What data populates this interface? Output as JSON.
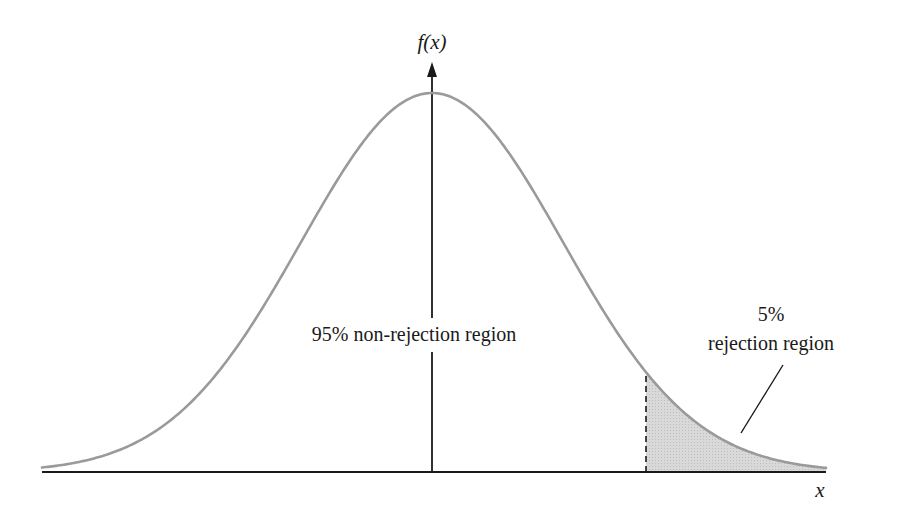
{
  "chart_data": {
    "type": "area",
    "title": "",
    "distribution": "normal",
    "xlabel": "x",
    "ylabel": "f(x)",
    "grid": false,
    "legend": null,
    "regions": [
      {
        "name": "non-rejection",
        "label": "95% non-rejection region",
        "percent": 95,
        "shaded": false
      },
      {
        "name": "rejection",
        "label_line1": "5%",
        "label_line2": "rejection region",
        "percent": 5,
        "shaded": true,
        "tail": "right"
      }
    ],
    "critical_value_z": 1.645,
    "x_range_z": [
      -3.0,
      3.0
    ],
    "annotations": [
      {
        "text": "95% non-rejection region",
        "position": "center-left of vertical axis"
      },
      {
        "text": "5% rejection region",
        "position": "upper right, with pointer line to shaded tail"
      }
    ]
  },
  "labels": {
    "y_axis": "f(x)",
    "x_axis": "x",
    "center_region": "95% non-rejection region",
    "tail_percent": "5%",
    "tail_region": "rejection region"
  },
  "geometry": {
    "baseline_y": 472,
    "axis_x0": 42,
    "axis_x1": 826,
    "mean_px": 432,
    "peak_y": 93,
    "sigma_px": 131,
    "critical_px": 646,
    "curve_x0": 42,
    "curve_x1": 826,
    "y_axis_top": 62
  },
  "colors": {
    "curve": "#9a9a9a",
    "axis": "#1a1a1a",
    "shade": "#d6d6d6",
    "background": "#ffffff"
  }
}
